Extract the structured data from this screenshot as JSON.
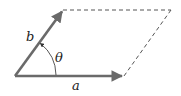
{
  "diagram": {
    "type": "vector-parallelogram",
    "labels": {
      "a": "a",
      "b": "b",
      "theta": "θ"
    },
    "colors": {
      "vector": "#6a6a6a",
      "dashed": "#555555",
      "arc": "#444444",
      "text": "#222222",
      "background": "#ffffff"
    },
    "points": {
      "origin": [
        15,
        76
      ],
      "a_tip": [
        124,
        76
      ],
      "b_tip": [
        63,
        10
      ],
      "far_corner": [
        171,
        10
      ]
    }
  }
}
